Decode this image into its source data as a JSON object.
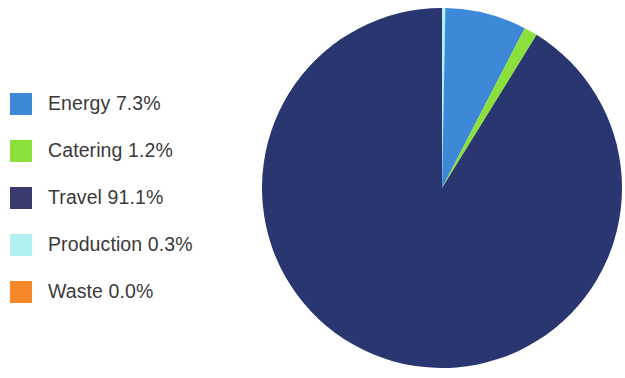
{
  "chart_data": {
    "type": "pie",
    "title": "",
    "categories": [
      "Energy",
      "Catering",
      "Travel",
      "Production",
      "Waste"
    ],
    "values": [
      7.3,
      1.2,
      91.1,
      0.3,
      0.0
    ],
    "value_unit": "%",
    "colors": [
      "#3e88d8",
      "#8ce03c",
      "#2a3670",
      "#b2f0f2",
      "#f8862a"
    ],
    "legend_position": "left",
    "grid": false,
    "start_angle_deg": 0,
    "direction": "clockwise",
    "slice_order": [
      "Production",
      "Energy",
      "Catering",
      "Travel",
      "Waste"
    ],
    "labels": [
      "Energy 7.3%",
      "Catering 1.2%",
      "Travel 91.1%",
      "Production 0.3%",
      "Waste 0.0%"
    ]
  },
  "legend": {
    "items": [
      {
        "label": "Energy 7.3%",
        "name": "Energy",
        "value": 7.3,
        "color": "#3e88d8"
      },
      {
        "label": "Catering 1.2%",
        "name": "Catering",
        "value": 1.2,
        "color": "#8ce03c"
      },
      {
        "label": "Travel 91.1%",
        "name": "Travel",
        "value": 91.1,
        "color": "#3a3a6e"
      },
      {
        "label": "Production 0.3%",
        "name": "Production",
        "value": 0.3,
        "color": "#b2f0f2"
      },
      {
        "label": "Waste 0.0%",
        "name": "Waste",
        "value": 0.0,
        "color": "#f8862a"
      }
    ]
  }
}
